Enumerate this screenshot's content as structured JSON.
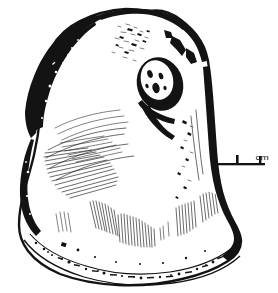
{
  "figure": {
    "kind": "scientific-line-drawing",
    "caption": "",
    "ink_color": "#131313",
    "background_color": "#ffffff"
  },
  "scale_bar": {
    "unit_label": "cm",
    "ticks": [
      "",
      "",
      ""
    ],
    "segments": 2,
    "bar_color": "#131313"
  },
  "features": {
    "muscle_scar_label": "",
    "umbo_label": "",
    "margin_label": ""
  }
}
